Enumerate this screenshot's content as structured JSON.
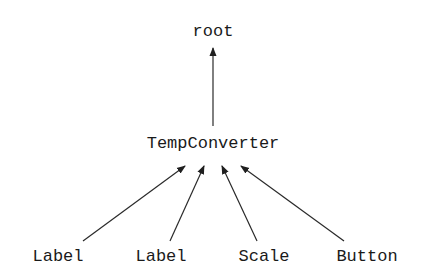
{
  "diagram": {
    "type": "tree",
    "root": {
      "label": "root"
    },
    "parent": {
      "label": "TempConverter"
    },
    "children": [
      {
        "label": "Label"
      },
      {
        "label": "Label"
      },
      {
        "label": "Scale"
      },
      {
        "label": "Button"
      }
    ],
    "edges": [
      {
        "from": "TempConverter",
        "to": "root"
      },
      {
        "from": "Label",
        "to": "TempConverter"
      },
      {
        "from": "Label",
        "to": "TempConverter"
      },
      {
        "from": "Scale",
        "to": "TempConverter"
      },
      {
        "from": "Button",
        "to": "TempConverter"
      }
    ]
  },
  "colors": {
    "line": "#2a2a2a",
    "text": "#1a1a1a",
    "background": "#ffffff"
  }
}
